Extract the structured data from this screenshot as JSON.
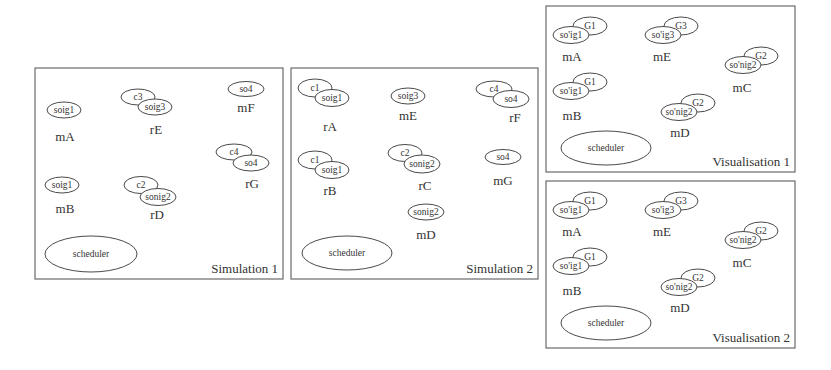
{
  "diagram": {
    "panels": [
      {
        "id": "simulation-1",
        "title": "Simulation 1",
        "rect": [
          35,
          68,
          248,
          211
        ],
        "scheduler": {
          "label": "scheduler",
          "cx": 91,
          "cy": 254,
          "rx": 46,
          "ry": 18
        },
        "nodes": [
          {
            "name": "mA",
            "label_pos": [
              65,
              141
            ],
            "ellipses": [
              {
                "text": "soig1",
                "cx": 64,
                "cy": 110,
                "rx": 17,
                "ry": 8
              }
            ]
          },
          {
            "name": "rE",
            "label_pos": [
              156,
              134
            ],
            "ellipses": [
              {
                "text": "c3",
                "cx": 138,
                "cy": 97,
                "rx": 17,
                "ry": 8
              },
              {
                "text": "soig3",
                "cx": 155,
                "cy": 107,
                "rx": 17,
                "ry": 8
              }
            ]
          },
          {
            "name": "mF",
            "label_pos": [
              246,
              112
            ],
            "ellipses": [
              {
                "text": "so4",
                "cx": 246,
                "cy": 89,
                "rx": 18,
                "ry": 7.5
              }
            ]
          },
          {
            "name": "rG",
            "label_pos": [
              252,
              188
            ],
            "ellipses": [
              {
                "text": "c4",
                "cx": 234,
                "cy": 152,
                "rx": 18,
                "ry": 8
              },
              {
                "text": "so4",
                "cx": 251,
                "cy": 163,
                "rx": 18,
                "ry": 8
              }
            ]
          },
          {
            "name": "mB",
            "label_pos": [
              65,
              213
            ],
            "ellipses": [
              {
                "text": "soig1",
                "cx": 62,
                "cy": 185,
                "rx": 17,
                "ry": 8
              }
            ]
          },
          {
            "name": "rD",
            "label_pos": [
              157,
              219
            ],
            "ellipses": [
              {
                "text": "c2",
                "cx": 141,
                "cy": 185,
                "rx": 17,
                "ry": 8.5
              },
              {
                "text": "sonig2",
                "cx": 158,
                "cy": 197,
                "rx": 18,
                "ry": 8.5
              }
            ]
          }
        ]
      },
      {
        "id": "simulation-2",
        "title": "Simulation 2",
        "rect": [
          291,
          68,
          247,
          211
        ],
        "scheduler": {
          "label": "scheduler",
          "cx": 347,
          "cy": 253,
          "rx": 45,
          "ry": 17
        },
        "nodes": [
          {
            "name": "rA",
            "label_pos": [
              330,
              131
            ],
            "ellipses": [
              {
                "text": "c1",
                "cx": 315,
                "cy": 88,
                "rx": 17,
                "ry": 9
              },
              {
                "text": "soig1",
                "cx": 332,
                "cy": 98,
                "rx": 17,
                "ry": 8.5
              }
            ]
          },
          {
            "name": "mE",
            "label_pos": [
              408,
              120
            ],
            "ellipses": [
              {
                "text": "soig3",
                "cx": 408,
                "cy": 96,
                "rx": 17,
                "ry": 8
              }
            ]
          },
          {
            "name": "rF",
            "label_pos": [
              515,
              122
            ],
            "ellipses": [
              {
                "text": "c4",
                "cx": 494,
                "cy": 89,
                "rx": 18,
                "ry": 8
              },
              {
                "text": "so4",
                "cx": 511,
                "cy": 99,
                "rx": 18,
                "ry": 8.5
              }
            ]
          },
          {
            "name": "rB",
            "label_pos": [
              330,
              195
            ],
            "ellipses": [
              {
                "text": "c1",
                "cx": 315,
                "cy": 160,
                "rx": 17,
                "ry": 9
              },
              {
                "text": "soig1",
                "cx": 332,
                "cy": 170,
                "rx": 17,
                "ry": 8.5
              }
            ]
          },
          {
            "name": "rC",
            "label_pos": [
              425,
              190
            ],
            "ellipses": [
              {
                "text": "c2",
                "cx": 405,
                "cy": 153,
                "rx": 17,
                "ry": 8.5
              },
              {
                "text": "sonig2",
                "cx": 422,
                "cy": 164,
                "rx": 18,
                "ry": 9
              }
            ]
          },
          {
            "name": "mG",
            "label_pos": [
              503,
              185
            ],
            "ellipses": [
              {
                "text": "so4",
                "cx": 503,
                "cy": 157,
                "rx": 18,
                "ry": 7.5
              }
            ]
          },
          {
            "name": "mD",
            "label_pos": [
              426,
              239
            ],
            "ellipses": [
              {
                "text": "sonig2",
                "cx": 426,
                "cy": 212,
                "rx": 18,
                "ry": 8
              }
            ]
          }
        ]
      },
      {
        "id": "visualisation-1",
        "title": "Visualisation 1",
        "rect": [
          546,
          6,
          249,
          166
        ],
        "scheduler": {
          "label": "scheduler",
          "cx": 606,
          "cy": 148,
          "rx": 45,
          "ry": 17
        },
        "nodes": [
          {
            "name": "mA",
            "label_pos": [
              572,
              61
            ],
            "ellipses": [
              {
                "text": "G1",
                "cx": 590,
                "cy": 26,
                "rx": 17,
                "ry": 9
              },
              {
                "text": "so'ig1",
                "cx": 571,
                "cy": 35,
                "rx": 18,
                "ry": 8.5
              }
            ]
          },
          {
            "name": "mE",
            "label_pos": [
              662,
              61
            ],
            "ellipses": [
              {
                "text": "G3",
                "cx": 681,
                "cy": 26,
                "rx": 17,
                "ry": 9
              },
              {
                "text": "so'ig3",
                "cx": 663,
                "cy": 35,
                "rx": 18,
                "ry": 8.5
              }
            ]
          },
          {
            "name": "mC",
            "label_pos": [
              742,
              92
            ],
            "ellipses": [
              {
                "text": "G2",
                "cx": 761,
                "cy": 56,
                "rx": 17,
                "ry": 9
              },
              {
                "text": "so'nig2",
                "cx": 743,
                "cy": 65,
                "rx": 18,
                "ry": 8.5
              }
            ]
          },
          {
            "name": "mB",
            "label_pos": [
              572,
              120
            ],
            "ellipses": [
              {
                "text": "G1",
                "cx": 590,
                "cy": 82,
                "rx": 17,
                "ry": 9
              },
              {
                "text": "so'ig1",
                "cx": 571,
                "cy": 91,
                "rx": 18,
                "ry": 8.5
              }
            ]
          },
          {
            "name": "mD",
            "label_pos": [
              680,
              137
            ],
            "ellipses": [
              {
                "text": "G2",
                "cx": 698,
                "cy": 103,
                "rx": 17,
                "ry": 9
              },
              {
                "text": "so'nig2",
                "cx": 679,
                "cy": 112,
                "rx": 18,
                "ry": 8.5
              }
            ]
          }
        ]
      },
      {
        "id": "visualisation-2",
        "title": "Visualisation 2",
        "rect": [
          546,
          181,
          249,
          167
        ],
        "scheduler": {
          "label": "scheduler",
          "cx": 606,
          "cy": 323,
          "rx": 45,
          "ry": 17
        },
        "nodes": [
          {
            "name": "mA",
            "label_pos": [
              572,
              236
            ],
            "ellipses": [
              {
                "text": "G1",
                "cx": 590,
                "cy": 201,
                "rx": 17,
                "ry": 9
              },
              {
                "text": "so'ig1",
                "cx": 571,
                "cy": 210,
                "rx": 18,
                "ry": 8.5
              }
            ]
          },
          {
            "name": "mE",
            "label_pos": [
              662,
              236
            ],
            "ellipses": [
              {
                "text": "G3",
                "cx": 681,
                "cy": 201,
                "rx": 17,
                "ry": 9
              },
              {
                "text": "so'ig3",
                "cx": 663,
                "cy": 210,
                "rx": 18,
                "ry": 8.5
              }
            ]
          },
          {
            "name": "mC",
            "label_pos": [
              742,
              267
            ],
            "ellipses": [
              {
                "text": "G2",
                "cx": 761,
                "cy": 231,
                "rx": 17,
                "ry": 9
              },
              {
                "text": "so'nig2",
                "cx": 743,
                "cy": 240,
                "rx": 18,
                "ry": 8.5
              }
            ]
          },
          {
            "name": "mB",
            "label_pos": [
              572,
              295
            ],
            "ellipses": [
              {
                "text": "G1",
                "cx": 590,
                "cy": 257,
                "rx": 17,
                "ry": 9
              },
              {
                "text": "so'ig1",
                "cx": 571,
                "cy": 266,
                "rx": 18,
                "ry": 8.5
              }
            ]
          },
          {
            "name": "mD",
            "label_pos": [
              680,
              312
            ],
            "ellipses": [
              {
                "text": "G2",
                "cx": 698,
                "cy": 278,
                "rx": 17,
                "ry": 9
              },
              {
                "text": "so'nig2",
                "cx": 679,
                "cy": 287,
                "rx": 18,
                "ry": 8.5
              }
            ]
          }
        ]
      }
    ]
  }
}
